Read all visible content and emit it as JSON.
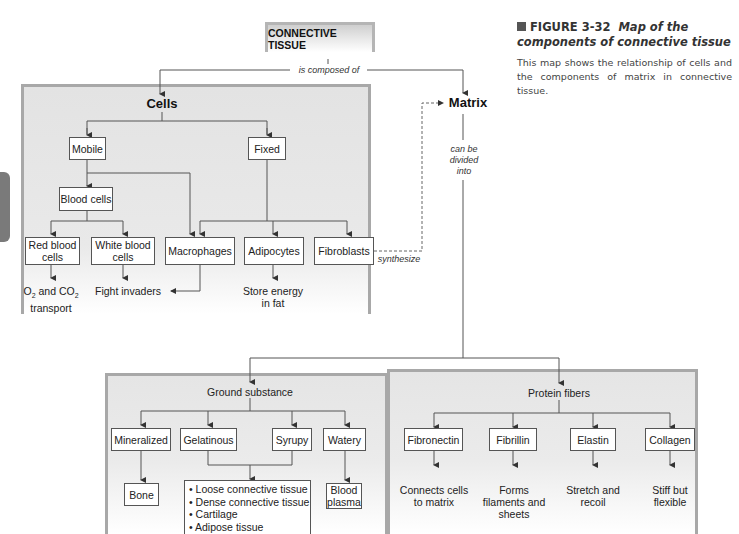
{
  "figure": {
    "number": "FIGURE 3-32",
    "title": "Map of the components of connective tissue",
    "description": "This map shows the relationship of cells and the components of matrix in connective tissue."
  },
  "root": {
    "label": "CONNECTIVE TISSUE",
    "link_label": "is composed of"
  },
  "cells": {
    "heading": "Cells",
    "mobile": "Mobile",
    "fixed": "Fixed",
    "blood_cells": "Blood cells",
    "red_blood_cells": "Red blood cells",
    "white_blood_cells": "White blood cells",
    "macrophages": "Macrophages",
    "adipocytes": "Adipocytes",
    "fibroblasts": "Fibroblasts",
    "red_function_prefix": "O",
    "red_function_sub1": "2",
    "red_function_mid": " and CO",
    "red_function_sub2": "2",
    "red_function_line2": "transport",
    "white_function": "Fight invaders",
    "adipocyte_function": "Store energy in fat",
    "synthesize_label": "synthesize"
  },
  "matrix": {
    "heading": "Matrix",
    "link_label": "can be divided into"
  },
  "ground_substance": {
    "heading": "Ground substance",
    "types": [
      "Mineralized",
      "Gelatinous",
      "Syrupy",
      "Watery"
    ],
    "mineralized_result": "Bone",
    "watery_result": "Blood plasma",
    "gel_syrupy_results": [
      "Loose connective tissue",
      "Dense connective tissue",
      "Cartilage",
      "Adipose tissue"
    ]
  },
  "protein_fibers": {
    "heading": "Protein fibers",
    "types": [
      "Fibronectin",
      "Fibrillin",
      "Elastin",
      "Collagen"
    ],
    "functions": [
      "Connects cells to matrix",
      "Forms filaments and sheets",
      "Stretch and recoil",
      "Stiff but flexible"
    ]
  }
}
